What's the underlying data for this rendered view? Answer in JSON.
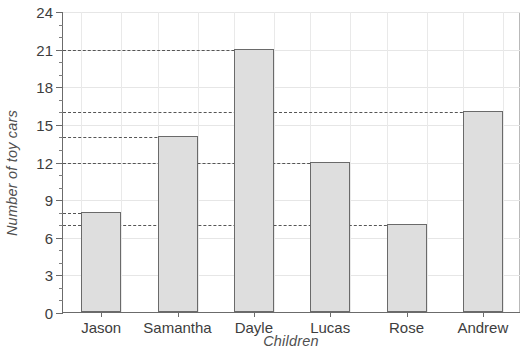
{
  "chart_data": {
    "type": "bar",
    "title": "",
    "xlabel": "Children",
    "ylabel": "Number of toy cars",
    "categories": [
      "Jason",
      "Samantha",
      "Dayle",
      "Lucas",
      "Rose",
      "Andrew"
    ],
    "values": [
      8,
      14,
      21,
      12,
      7,
      16
    ],
    "ylim": [
      0,
      24
    ],
    "ytick_major_step": 3,
    "ytick_minor_step": 1,
    "ytick_labels": [
      "0",
      "3",
      "6",
      "9",
      "12",
      "15",
      "18",
      "21",
      "24"
    ],
    "grid": true,
    "legend": "none",
    "reference_lines": [
      21,
      16,
      14,
      12,
      8,
      7
    ],
    "colors": {
      "bar_fill": "#dedede",
      "bar_edge": "#6a6a6a",
      "grid": "#e6e6e6",
      "axis": "#6b6b6b",
      "dashed_line": "#555555",
      "text": "#3d3d3d",
      "background": "#ffffff"
    }
  },
  "axis": {
    "y_title": "Number of toy cars",
    "x_title": "Children"
  }
}
